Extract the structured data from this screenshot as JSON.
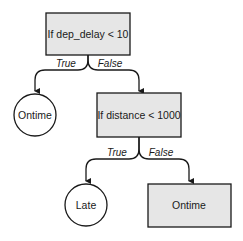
{
  "diagram": {
    "type": "decision-tree",
    "colors": {
      "box_fill": "#e6e6e6",
      "stroke": "#1a1a1a",
      "background": "#ffffff"
    },
    "nodes": [
      {
        "id": "root",
        "shape": "rect",
        "label": "If dep_delay < 10"
      },
      {
        "id": "leaf1",
        "shape": "circle",
        "label": "Ontime"
      },
      {
        "id": "split2",
        "shape": "rect",
        "label": "If distance < 1000"
      },
      {
        "id": "leaf2",
        "shape": "circle",
        "label": "Late"
      },
      {
        "id": "leaf3",
        "shape": "rect",
        "label": "Ontime"
      }
    ],
    "edges": [
      {
        "from": "root",
        "to": "leaf1",
        "label": "True"
      },
      {
        "from": "root",
        "to": "split2",
        "label": "False"
      },
      {
        "from": "split2",
        "to": "leaf2",
        "label": "True"
      },
      {
        "from": "split2",
        "to": "leaf3",
        "label": "False"
      }
    ]
  }
}
